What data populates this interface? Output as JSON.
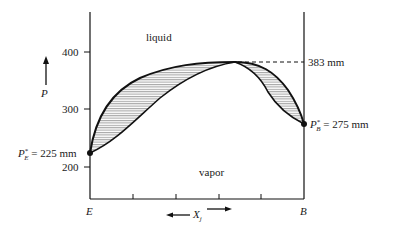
{
  "diagram": {
    "y_axis": {
      "label": "P",
      "ticks": [
        {
          "value": 200,
          "label": "200"
        },
        {
          "value": 300,
          "label": "300"
        },
        {
          "value": 400,
          "label": "400"
        }
      ]
    },
    "x_axis": {
      "label": "X",
      "label_subscript": "j",
      "left_end": "E",
      "right_end": "B",
      "tick_count": 6
    },
    "regions": {
      "upper": "liquid",
      "lower": "vapor"
    },
    "annotations": {
      "left_point": {
        "symbol": "P",
        "superscript": "*",
        "subscript": "E",
        "text": "= 225 mm",
        "value": 225
      },
      "right_point": {
        "symbol": "P",
        "superscript": "*",
        "subscript": "B",
        "text": "= 275 mm",
        "value": 275
      },
      "azeotrope": {
        "text": "383 mm",
        "value": 383
      }
    },
    "colors": {
      "line": "#111111",
      "hatch": "#555555",
      "background": "#ffffff"
    }
  }
}
